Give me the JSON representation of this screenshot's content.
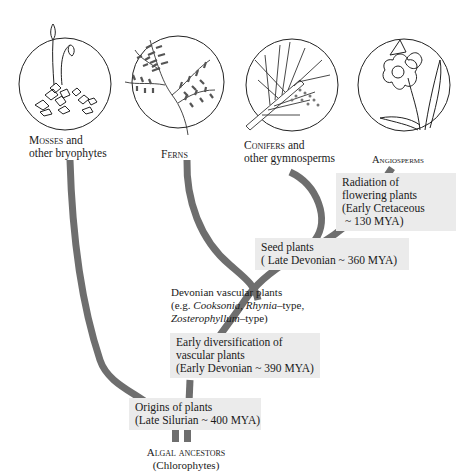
{
  "diagram": {
    "type": "phylogenetic tree",
    "groups": [
      {
        "id": "mosses",
        "label_caps": "Mosses",
        "label_rest": " and",
        "label_line2": "other bryophytes",
        "icon": "moss-illustration-icon"
      },
      {
        "id": "ferns",
        "label_caps": "Ferns",
        "icon": "fern-frond-illustration-icon"
      },
      {
        "id": "conifers",
        "label_caps": "Conifers",
        "label_rest": " and",
        "label_line2": "other gymnosperms",
        "icon": "conifer-branch-illustration-icon"
      },
      {
        "id": "angiosperms",
        "label_caps": "Angiosperms",
        "icon": "daffodil-flower-illustration-icon"
      }
    ],
    "nodes": {
      "radiation": {
        "line1": "Radiation of",
        "line2": "flowering plants",
        "line3": "(Early Cretaceous",
        "line4": "~ 130 MYA)"
      },
      "seed": {
        "line1": "Seed plants",
        "line2": "( Late  Devonian ~ 360 MYA)"
      },
      "devonian": {
        "line1": "Devonian vascular plants",
        "line2_prefix": "(e.g. ",
        "line2_italic1": "Cooksonia",
        "line2_mid": ", ",
        "line2_italic2": "Rhynia",
        "line2_suffix": "–type,",
        "line3_italic": "Zosterophyllum",
        "line3_suffix": "–type)"
      },
      "early_div": {
        "line1": "Early diversification of",
        "line2": "vascular plants",
        "line3": "(Early Devonian ~ 390 MYA)"
      },
      "origins": {
        "line1": "Origins of plants",
        "line2": "(Late Silurian ~ 400 MYA)"
      }
    },
    "root": {
      "label_caps": "Algal ancestors",
      "line2": "(Chlorophytes)"
    },
    "colors": {
      "branch": "#6e6e6e",
      "box_fill": "#ebebeb",
      "outline": "#222222"
    }
  }
}
